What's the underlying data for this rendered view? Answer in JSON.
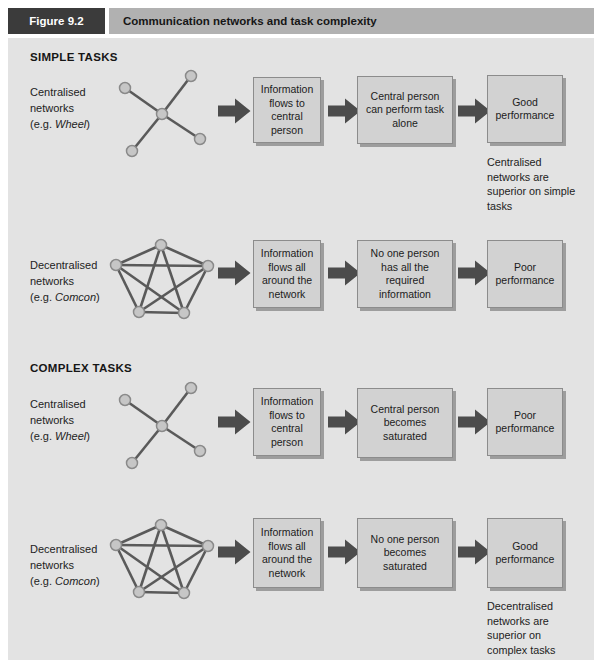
{
  "header": {
    "figure_label": "Figure 9.2",
    "title": "Communication networks and task complexity"
  },
  "sections": {
    "simple": "SIMPLE TASKS",
    "complex": "COMPLEX TASKS"
  },
  "rows": [
    {
      "label_line1": "Centralised",
      "label_line2": "networks",
      "eg_prefix": "(e.g. ",
      "eg_name": "Wheel",
      "eg_suffix": ")",
      "network_type": "wheel: 5 nodes, central node connected to 4 outer nodes",
      "box1": "Information flows to central person",
      "box2": "Central person can perform task alone",
      "box3": "Good performance",
      "note": "Centralised networks are superior on simple tasks"
    },
    {
      "label_line1": "Decentralised",
      "label_line2": "networks",
      "eg_prefix": "(e.g. ",
      "eg_name": "Comcon",
      "eg_suffix": ")",
      "network_type": "comcon: 5 nodes, every node connected to every other",
      "box1": "Information flows all around the network",
      "box2": "No one person has all the required information",
      "box3": "Poor performance"
    },
    {
      "label_line1": "Centralised",
      "label_line2": "networks",
      "eg_prefix": "(e.g. ",
      "eg_name": "Wheel",
      "eg_suffix": ")",
      "network_type": "wheel: 5 nodes, central node connected to 4 outer nodes",
      "box1": "Information flows to central person",
      "box2": "Central person becomes saturated",
      "box3": "Poor performance"
    },
    {
      "label_line1": "Decentralised",
      "label_line2": "networks",
      "eg_prefix": "(e.g. ",
      "eg_name": "Comcon",
      "eg_suffix": ")",
      "network_type": "comcon: 5 nodes, every node connected to every other",
      "box1": "Information flows all around the network",
      "box2": "No one person becomes saturated",
      "box3": "Good performance",
      "note": "Decentralised networks are superior on complex tasks"
    }
  ],
  "colors": {
    "panel_bg": "#e3e3e3",
    "box_bg": "#d2d2d2",
    "box_border": "#8c8c8c",
    "box_shadow": "#9d9d9d",
    "arrow": "#4c4c4c",
    "figure_label_bg": "#3b3b3b",
    "title_bar_bg": "#b1b1b1",
    "node_fill": "#c6c6c6",
    "node_border": "#8a8a8a",
    "edge": "#5a5a5a"
  }
}
